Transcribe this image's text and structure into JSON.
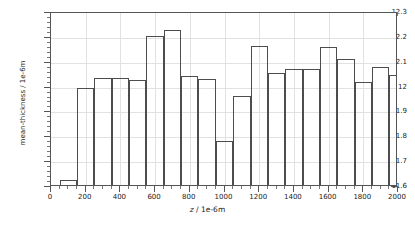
{
  "chart_data": {
    "type": "bar",
    "title": "",
    "subtitle": "",
    "xlabel": "z / 1e-6m",
    "xlabel_var": "z",
    "xlabel_rest": " / 1e-6m",
    "ylabel": "mean-thickness / 1e-6m",
    "xlim": [
      0,
      2000
    ],
    "ylim": [
      11.6,
      12.3
    ],
    "grid": true,
    "legend": null,
    "legend_position": "none",
    "x_ticks": [
      0,
      200,
      400,
      600,
      800,
      1000,
      1200,
      1400,
      1600,
      1800,
      2000
    ],
    "x_tick_labels": [
      "0",
      "200",
      "400",
      "600",
      "800",
      "1000",
      "1200",
      "1400",
      "1600",
      "1800",
      "2000"
    ],
    "y_ticks": [
      11.6,
      11.7,
      11.8,
      11.9,
      12.0,
      12.1,
      12.2,
      12.3
    ],
    "y_tick_labels": [
      "11.6",
      "11.7",
      "11.8",
      "11.9",
      "12",
      "12.1",
      "12.2",
      "12.3"
    ],
    "bar_width": 100,
    "bar_edge_color": "#4d4d4d",
    "bar_fill_color": "#ffffff",
    "grid_color": "#e2e2e2",
    "axis_color": "#555555",
    "bins": [
      {
        "x_start": 50,
        "x_end": 150,
        "x_center": 100,
        "value": 11.622
      },
      {
        "x_start": 150,
        "x_end": 250,
        "x_center": 200,
        "value": 11.992
      },
      {
        "x_start": 250,
        "x_end": 350,
        "x_center": 300,
        "value": 12.029
      },
      {
        "x_start": 350,
        "x_end": 450,
        "x_center": 400,
        "value": 12.03
      },
      {
        "x_start": 450,
        "x_end": 550,
        "x_center": 500,
        "value": 12.024
      },
      {
        "x_start": 550,
        "x_end": 650,
        "x_center": 600,
        "value": 12.2
      },
      {
        "x_start": 650,
        "x_end": 750,
        "x_center": 700,
        "value": 12.222
      },
      {
        "x_start": 750,
        "x_end": 850,
        "x_center": 800,
        "value": 12.037
      },
      {
        "x_start": 850,
        "x_end": 950,
        "x_center": 900,
        "value": 12.028
      },
      {
        "x_start": 950,
        "x_end": 1050,
        "x_center": 1000,
        "value": 11.779
      },
      {
        "x_start": 1050,
        "x_end": 1150,
        "x_center": 1100,
        "value": 11.959
      },
      {
        "x_start": 1150,
        "x_end": 1250,
        "x_center": 1200,
        "value": 12.158
      },
      {
        "x_start": 1250,
        "x_end": 1350,
        "x_center": 1300,
        "value": 12.051
      },
      {
        "x_start": 1350,
        "x_end": 1450,
        "x_center": 1400,
        "value": 12.068
      },
      {
        "x_start": 1450,
        "x_end": 1550,
        "x_center": 1500,
        "value": 12.065
      },
      {
        "x_start": 1550,
        "x_end": 1650,
        "x_center": 1600,
        "value": 12.155
      },
      {
        "x_start": 1650,
        "x_end": 1750,
        "x_center": 1700,
        "value": 12.108
      },
      {
        "x_start": 1750,
        "x_end": 1850,
        "x_center": 1800,
        "value": 12.014
      },
      {
        "x_start": 1850,
        "x_end": 1950,
        "x_center": 1900,
        "value": 12.076
      },
      {
        "x_start": 1950,
        "x_end": 2050,
        "x_center": 2000,
        "value": 12.041
      }
    ],
    "categories": [
      "100",
      "200",
      "300",
      "400",
      "500",
      "600",
      "700",
      "800",
      "900",
      "1000",
      "1100",
      "1200",
      "1300",
      "1400",
      "1500",
      "1600",
      "1700",
      "1800",
      "1900",
      "2000"
    ],
    "values": [
      11.622,
      11.992,
      12.029,
      12.03,
      12.024,
      12.2,
      12.222,
      12.037,
      12.028,
      11.779,
      11.959,
      12.158,
      12.051,
      12.068,
      12.065,
      12.155,
      12.108,
      12.014,
      12.076,
      12.041
    ]
  }
}
